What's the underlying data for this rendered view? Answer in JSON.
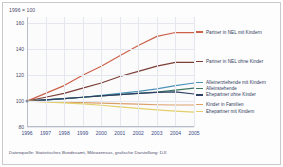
{
  "figure": {
    "unit_note": "1996 = 100",
    "source_note": "Datenquelle: Statistisches Bundesamt, Mikrozensus, grafische Darstellung: DJI"
  },
  "chart_data": {
    "type": "line",
    "title": "",
    "subtitle": "",
    "xlabel": "",
    "ylabel": "1996 = 100",
    "x": [
      "1996",
      "1997",
      "1998",
      "1999",
      "2000",
      "2001",
      "2002",
      "2003",
      "2004",
      "2005"
    ],
    "xlim": [
      1996,
      2005
    ],
    "ylim": [
      80,
      165
    ],
    "yticks": [
      "80",
      "100",
      "120",
      "140",
      "160"
    ],
    "ytick_values": [
      80,
      100,
      120,
      140,
      160
    ],
    "grid": true,
    "legend_position": "right",
    "series": [
      {
        "name": "Partner in NEL mit Kindern",
        "color": "#cc6149",
        "values": [
          100,
          106,
          112,
          120,
          127,
          135,
          143,
          150,
          153,
          153
        ]
      },
      {
        "name": "Partner in NEL ohne Kinder",
        "color": "#7b3f36",
        "values": [
          100,
          103,
          106,
          110,
          114,
          119,
          123,
          127,
          130,
          130
        ]
      },
      {
        "name": "Alleinerziehende mit Kindern",
        "color": "#4f93b8",
        "values": [
          100,
          101,
          102,
          103,
          104.5,
          106,
          107.5,
          109.5,
          112,
          114
        ]
      },
      {
        "name": "Alleinstehende",
        "color": "#3d7a62",
        "values": [
          100,
          101,
          102,
          103,
          104,
          105,
          106,
          107,
          108.5,
          110
        ]
      },
      {
        "name": "Ehepartner ohne Kinder",
        "color": "#2e3f63",
        "values": [
          100,
          101,
          102,
          103,
          104,
          105,
          106,
          106.8,
          107.2,
          105.5
        ]
      },
      {
        "name": "Kinder in Familien",
        "color": "#dba06a",
        "values": [
          100,
          99.6,
          99.2,
          98.8,
          98.4,
          98,
          97.6,
          97.2,
          97,
          97
        ]
      },
      {
        "name": "Ehepartner mit Kindern",
        "color": "#e3cf6a",
        "values": [
          100,
          99.4,
          98.6,
          97.8,
          96.8,
          95.6,
          94.4,
          93.2,
          92.2,
          91.5
        ]
      }
    ]
  },
  "legend": {
    "items": [
      {
        "label": "Partner in NEL mit Kindern",
        "color": "#cc6149"
      },
      {
        "label": "Partner in NEL ohne Kinder",
        "color": "#7b3f36"
      },
      {
        "label": "Alleinerziehende mit Kindern",
        "color": "#4f93b8"
      },
      {
        "label": "Alleinstehende",
        "color": "#3d7a62"
      },
      {
        "label": "Ehepartner ohne Kinder",
        "color": "#2e3f63"
      },
      {
        "label": "Kinder in Familien",
        "color": "#dba06a"
      },
      {
        "label": "Ehepartner mit Kindern",
        "color": "#e3cf6a"
      }
    ]
  }
}
